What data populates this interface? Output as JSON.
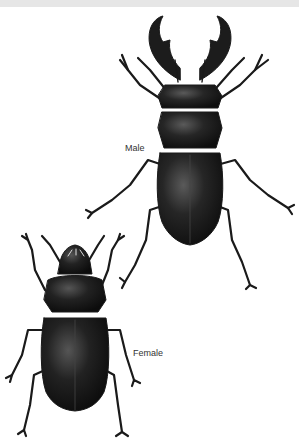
{
  "figure": {
    "specimens": [
      {
        "id": "male",
        "label": "Male"
      },
      {
        "id": "female",
        "label": "Female"
      }
    ],
    "colors": {
      "background": "#ffffff",
      "top_strip": "#e6e6e6",
      "beetle_body": "#1a1a1a",
      "beetle_highlight": "#555555",
      "label_text": "#333333"
    }
  }
}
